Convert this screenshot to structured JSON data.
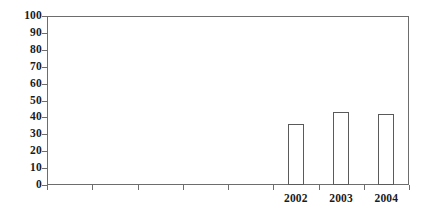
{
  "chart_data": {
    "type": "bar",
    "title": "",
    "subtitle": "",
    "xlabel": "",
    "ylabel": "",
    "categories": [
      "2002",
      "2003",
      "2004"
    ],
    "values": [
      36,
      43,
      42
    ],
    "series": [
      {
        "name": "",
        "values": [
          36,
          43,
          42
        ]
      }
    ],
    "ylim": [
      0,
      100
    ],
    "y_ticks": [
      0,
      10,
      20,
      30,
      40,
      50,
      60,
      70,
      80,
      90,
      100
    ],
    "y_tick_labels": [
      "0",
      "10",
      "20",
      "30",
      "40",
      "50",
      "60",
      "70",
      "80",
      "90",
      "100"
    ],
    "x_tick_count": 8,
    "x_tick_labels": [
      "",
      "",
      "",
      "",
      "",
      "2002",
      "2003",
      "2004"
    ],
    "x_labeled_positions": [
      5,
      6,
      7
    ],
    "grid": false,
    "legend": false,
    "legend_position": "none",
    "bar_fill": "#ffffff",
    "bar_edge_color": "#5a5a5a",
    "axis_color": "#6d6d6d",
    "text_color": "#1b1b1b",
    "background": "#ffffff",
    "annotations": []
  },
  "figure": {
    "plot_area": {
      "left": 47,
      "top": 16,
      "width": 362,
      "height": 169
    }
  }
}
